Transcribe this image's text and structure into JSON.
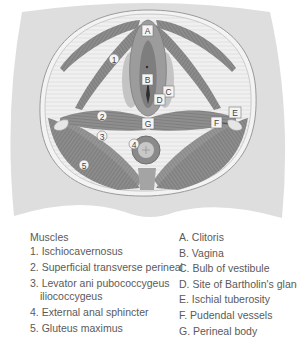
{
  "figure": {
    "colors": {
      "background_body": "#dcdcdc",
      "pelvic_outline": "#f2f2f2",
      "muscle": "#8a8a8a",
      "muscle_dark": "#6e6e6e",
      "label_box": "#f4f4f4"
    },
    "letter_labels": [
      "A",
      "B",
      "C",
      "D",
      "E",
      "F",
      "G"
    ],
    "number_labels": [
      "1",
      "2",
      "3",
      "4",
      "5"
    ]
  },
  "legend": {
    "muscles": {
      "title": "Muscles",
      "items": [
        {
          "text": "1. Ischiocavernosus"
        },
        {
          "text": "2. Superficial transverse perineal"
        },
        {
          "text": "3. Levator ani pubococcygeus",
          "continuation": "iliococcygeus"
        },
        {
          "text": "4. External anal sphincter"
        },
        {
          "text": "5. Gluteus maximus"
        }
      ]
    },
    "structures": {
      "items": [
        {
          "text": "A. Clitoris"
        },
        {
          "text": "B. Vagina"
        },
        {
          "text": "C. Bulb of vestibule"
        },
        {
          "text": "D. Site of Bartholin's gland"
        },
        {
          "text": "E. Ischial tuberosity"
        },
        {
          "text": "F. Pudendal vessels"
        },
        {
          "text": "G. Perineal body"
        }
      ]
    }
  }
}
